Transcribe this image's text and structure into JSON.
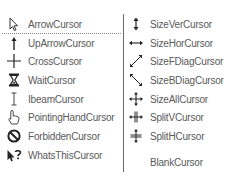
{
  "left_column": {
    "items": [
      {
        "label": "ArrowCursor",
        "icon": "arrow-cursor-icon"
      },
      {
        "label": "UpArrowCursor",
        "icon": "up-arrow-cursor-icon"
      },
      {
        "label": "CrossCursor",
        "icon": "cross-cursor-icon"
      },
      {
        "label": "WaitCursor",
        "icon": "hourglass-icon"
      },
      {
        "label": "IbeamCursor",
        "icon": "ibeam-icon"
      },
      {
        "label": "PointingHandCursor",
        "icon": "pointing-hand-icon"
      },
      {
        "label": "ForbiddenCursor",
        "icon": "forbidden-icon"
      },
      {
        "label": "WhatsThisCursor",
        "icon": "whats-this-icon"
      }
    ]
  },
  "right_column": {
    "items": [
      {
        "label": "SizeVerCursor",
        "icon": "size-vertical-icon"
      },
      {
        "label": "SizeHorCursor",
        "icon": "size-horizontal-icon"
      },
      {
        "label": "SizeFDiagCursor",
        "icon": "size-fdiag-icon"
      },
      {
        "label": "SizeBDiagCursor",
        "icon": "size-bdiag-icon"
      },
      {
        "label": "SizeAllCursor",
        "icon": "size-all-icon"
      },
      {
        "label": "SplitVCursor",
        "icon": "split-v-icon"
      },
      {
        "label": "SplitHCursor",
        "icon": "split-h-icon"
      },
      {
        "label": "BlankCursor",
        "icon": "blank-icon"
      }
    ]
  },
  "colors": {
    "text": "#5a5a5a",
    "divider": "#6a6a6a",
    "icon": "#222222"
  }
}
